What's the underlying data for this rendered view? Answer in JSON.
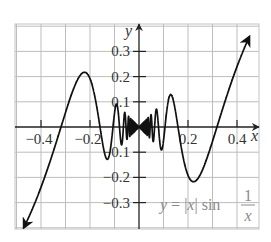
{
  "chart_data": {
    "type": "line",
    "title": "",
    "function": "y = |x| sin(1/x)",
    "xlabel": "x",
    "ylabel": "y",
    "xlim": [
      -0.5,
      0.5
    ],
    "ylim": [
      -0.4,
      0.4
    ],
    "x_ticks": [
      -0.4,
      -0.2,
      0.2,
      0.4
    ],
    "x_tick_labels": [
      "−0.4",
      "−0.2",
      "0.2",
      "0.4"
    ],
    "y_ticks": [
      0.3,
      0.2,
      0.1,
      -0.1,
      -0.2,
      -0.3
    ],
    "y_tick_labels": [
      "0.3",
      "0.2",
      "0.1",
      "−0.1",
      "−0.2",
      "−0.3"
    ],
    "grid": true,
    "grid_step": 0.1,
    "domain_shown": [
      -0.47,
      0.45
    ],
    "series": [
      {
        "name": "y = |x| sin 1/x",
        "x": [
          -0.47,
          -0.4,
          -0.318,
          -0.25,
          -0.212,
          -0.15,
          -0.106,
          -0.08,
          -0.064,
          -0.05,
          -0.02,
          0.02,
          0.05,
          0.064,
          0.08,
          0.106,
          0.15,
          0.212,
          0.25,
          0.318,
          0.4,
          0.45
        ],
        "values": [
          -0.4,
          -0.24,
          0.0,
          0.19,
          0.22,
          0.05,
          -0.11,
          -0.05,
          0.06,
          0.05,
          -0.02,
          -0.02,
          0.05,
          0.06,
          -0.05,
          -0.11,
          0.06,
          -0.22,
          -0.19,
          0.0,
          0.24,
          0.36
        ]
      }
    ],
    "annotations": [
      {
        "text": "y = |x| sin 1/x",
        "position": "lower right"
      }
    ],
    "legend": "none"
  },
  "labels": {
    "x_axis": "x",
    "y_axis": "y",
    "formula_lhs": "y",
    "formula_eq": " = |",
    "formula_x": "x",
    "formula_bar": "| sin ",
    "formula_num": "1",
    "formula_den": "x"
  },
  "colors": {
    "curve": "#111111",
    "grid": "#bdbdbd",
    "axis": "#222222",
    "formula": "#8a8a8a"
  }
}
